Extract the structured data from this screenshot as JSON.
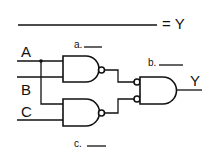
{
  "diagram": {
    "type": "logic-circuit",
    "equation": {
      "blank": "",
      "equals_label": "= Y"
    },
    "inputs": [
      {
        "id": "A",
        "label": "A"
      },
      {
        "id": "B",
        "label": "B"
      },
      {
        "id": "C",
        "label": "C"
      }
    ],
    "gates": [
      {
        "id": "gate1",
        "type": "NAND",
        "inputs": [
          "A",
          "B"
        ],
        "annotation": "a."
      },
      {
        "id": "gate2",
        "type": "NAND",
        "inputs": [
          "A",
          "C"
        ],
        "annotation": "c."
      },
      {
        "id": "gate3",
        "type": "AND with inverted inputs",
        "inputs": [
          "gate1",
          "gate2"
        ],
        "annotation": "b."
      }
    ],
    "output": {
      "label": "Y"
    },
    "annotations": {
      "a": "a.",
      "b": "b.",
      "c": "c."
    }
  }
}
